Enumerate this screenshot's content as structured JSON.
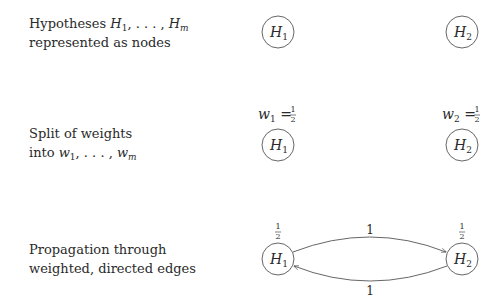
{
  "rows": [
    {
      "label": {
        "line1": "Hypotheses H1, ..., Hm",
        "line2": "represented as nodes"
      },
      "nodes": [
        {
          "id": "H1",
          "label": "H",
          "sub": "1"
        },
        {
          "id": "H2",
          "label": "H",
          "sub": "2"
        }
      ]
    },
    {
      "label": {
        "line1": "Split of weights",
        "line2": "into w1, ..., wm"
      },
      "weights": [
        {
          "text": "w1 = 1/2",
          "var": "w",
          "sub": "1",
          "num": "1",
          "den": "2"
        },
        {
          "text": "w2 = 1/2",
          "var": "w",
          "sub": "2",
          "num": "1",
          "den": "2"
        }
      ],
      "nodes": [
        {
          "id": "H1",
          "label": "H",
          "sub": "1"
        },
        {
          "id": "H2",
          "label": "H",
          "sub": "2"
        }
      ]
    },
    {
      "label": {
        "line1": "Propagation through",
        "line2": "weighted, directed edges"
      },
      "weights": [
        {
          "num": "1",
          "den": "2"
        },
        {
          "num": "1",
          "den": "2"
        }
      ],
      "nodes": [
        {
          "id": "H1",
          "label": "H",
          "sub": "1"
        },
        {
          "id": "H2",
          "label": "H",
          "sub": "2"
        }
      ],
      "edges": [
        {
          "from": "H1",
          "to": "H2",
          "weight": "1"
        },
        {
          "from": "H2",
          "to": "H1",
          "weight": "1"
        }
      ]
    }
  ],
  "text": {
    "r1_prefix": "Hypotheses ",
    "r1_line2": "represented as nodes",
    "r2_line1": "Split of weights",
    "r2_prefix": "into ",
    "r3_line1": "Propagation through",
    "r3_line2": "weighted, directed edges",
    "H": "H",
    "w": "w",
    "m": "m",
    "one": "1",
    "two": "2",
    "dots": ", . . . , ",
    "eq": " = ",
    "edge_top": "1",
    "edge_bottom": "1"
  },
  "colors": {
    "stroke": "#555555",
    "text": "#2a2a2a",
    "background": "#ffffff"
  }
}
